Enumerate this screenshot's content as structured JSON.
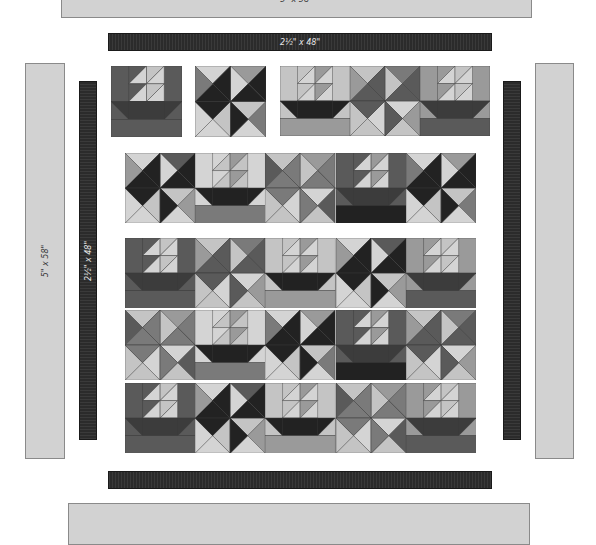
{
  "diagram": {
    "borders": {
      "top_outer": {
        "label": "5\" x 58\"",
        "color": "#d2d2d2"
      },
      "top_inner": {
        "label": "2½\" x 48\"",
        "color": "#2b2b2b"
      },
      "left_outer": {
        "label": "5\" x 58\"",
        "color": "#d2d2d2"
      },
      "left_inner": {
        "label": "2½\" x 48\"",
        "color": "#2b2b2b"
      },
      "right_inner": {
        "label": "",
        "color": "#2b2b2b"
      },
      "right_outer": {
        "label": "",
        "color": "#d2d2d2"
      },
      "bottom_inner": {
        "label": "",
        "color": "#2b2b2b"
      },
      "bottom_outer": {
        "label": "",
        "color": "#d2d2d2"
      }
    },
    "block_types": [
      "sailboat",
      "pinwheel"
    ],
    "rows": [
      {
        "name": "single-sailboat-block",
        "blocks": [
          "sailboat"
        ]
      },
      {
        "name": "single-pinwheel-block",
        "blocks": [
          "pinwheel"
        ]
      },
      {
        "name": "top-right-panel",
        "blocks": [
          "sailboat",
          "pinwheel",
          "sailboat"
        ]
      },
      {
        "name": "middle-panel",
        "blocks": [
          "pinwheel",
          "sailboat",
          "pinwheel",
          "sailboat",
          "pinwheel"
        ]
      },
      {
        "name": "main-panel-row-1",
        "blocks": [
          "sailboat",
          "pinwheel",
          "sailboat",
          "pinwheel",
          "sailboat"
        ]
      },
      {
        "name": "main-panel-row-2",
        "blocks": [
          "pinwheel",
          "sailboat",
          "pinwheel",
          "sailboat",
          "pinwheel"
        ]
      },
      {
        "name": "main-panel-row-3",
        "blocks": [
          "sailboat",
          "pinwheel",
          "sailboat",
          "pinwheel",
          "sailboat"
        ]
      }
    ],
    "palette": {
      "light": "#d4d4d4",
      "light2": "#c4c4c4",
      "mid": "#9a9a9a",
      "midDark": "#7a7a7a",
      "dark": "#5a5a5a",
      "darker": "#3c3c3c",
      "black": "#222222"
    }
  }
}
